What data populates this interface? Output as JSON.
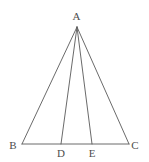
{
  "figure": {
    "kind": "geometry-diagram",
    "width": 149,
    "height": 162,
    "background_color": "#ffffff",
    "stroke_color": "#595959",
    "label_color": "#4d4d4d",
    "stroke_width": 0.9,
    "points": [
      {
        "id": "A",
        "label": "A",
        "x": 77,
        "y": 27,
        "label_x": 76.5,
        "label_y": 11
      },
      {
        "id": "B",
        "label": "B",
        "x": 22,
        "y": 144,
        "label_x": 13,
        "label_y": 140
      },
      {
        "id": "D",
        "label": "D",
        "x": 61,
        "y": 144,
        "label_x": 61,
        "label_y": 148
      },
      {
        "id": "E",
        "label": "E",
        "x": 92,
        "y": 144,
        "label_x": 92,
        "label_y": 148
      },
      {
        "id": "C",
        "label": "C",
        "x": 129,
        "y": 144,
        "label_x": 135,
        "label_y": 140
      }
    ],
    "segments": [
      {
        "id": "AB",
        "name": "segment-ab",
        "from": "A",
        "to": "B"
      },
      {
        "id": "AC",
        "name": "segment-ac",
        "from": "A",
        "to": "C"
      },
      {
        "id": "BC",
        "name": "segment-bc",
        "from": "B",
        "to": "C"
      },
      {
        "id": "AD",
        "name": "cevian-ad",
        "from": "A",
        "to": "D"
      },
      {
        "id": "AE",
        "name": "cevian-ae",
        "from": "A",
        "to": "E"
      }
    ]
  }
}
